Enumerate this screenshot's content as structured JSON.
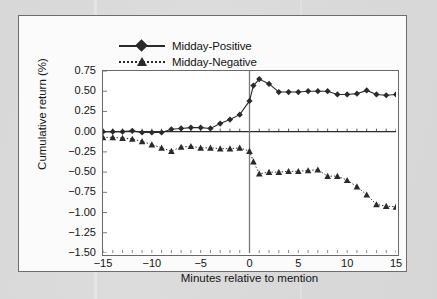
{
  "figure": {
    "background_color": "#d9d9d9",
    "panel_color": "#fbfbfb",
    "plot_background": "#ffffff",
    "axis_color": "#6a6a6a",
    "ink_color": "#2a2a2a"
  },
  "chart_data": {
    "type": "line",
    "title": "",
    "xlabel": "Minutes relative to mention",
    "ylabel": "Cumulative return (%)",
    "xlim": [
      -15,
      15
    ],
    "ylim": [
      -1.5,
      0.75
    ],
    "xticks": [
      -15,
      -10,
      -5,
      0,
      5,
      10,
      15
    ],
    "xticklabels": [
      "−15",
      "−10",
      "−5",
      "0",
      "5",
      "10",
      "15"
    ],
    "xminor_step": 1,
    "yticks": [
      0.75,
      0.5,
      0.25,
      0.0,
      -0.25,
      -0.5,
      -0.75,
      -1.0,
      -1.25,
      -1.5
    ],
    "yticklabels": [
      "0.75",
      "0.50",
      "0.25",
      "0.00",
      "−0.25",
      "−0.50",
      "−0.75",
      "−1.00",
      "−1.25",
      "−1.50"
    ],
    "grid": false,
    "legend_position": "above-plot",
    "reference_lines": [
      {
        "name": "zero-return-line",
        "axis": "horizontal",
        "value": 0.0
      },
      {
        "name": "mention-time-line",
        "axis": "vertical",
        "value": 0
      }
    ],
    "x": [
      -15,
      -14,
      -13,
      -12,
      -11,
      -10,
      -9,
      -8,
      -7,
      -6,
      -5,
      -4,
      -3,
      -2,
      -1,
      0,
      0.4,
      1,
      2,
      3,
      4,
      5,
      6,
      7,
      8,
      9,
      10,
      11,
      12,
      13,
      14,
      15
    ],
    "series": [
      {
        "name": "Midday-Positive",
        "marker": "diamond",
        "linestyle": "solid",
        "color": "#2a2a2a",
        "values": [
          0.0,
          0.0,
          0.0,
          0.01,
          -0.01,
          -0.01,
          -0.01,
          0.03,
          0.04,
          0.05,
          0.05,
          0.04,
          0.1,
          0.15,
          0.21,
          0.38,
          0.57,
          0.65,
          0.59,
          0.49,
          0.49,
          0.49,
          0.5,
          0.5,
          0.5,
          0.46,
          0.46,
          0.47,
          0.51,
          0.46,
          0.45,
          0.46
        ]
      },
      {
        "name": "Midday-Negative",
        "marker": "triangle",
        "linestyle": "dotted",
        "color": "#2a2a2a",
        "values": [
          -0.07,
          -0.07,
          -0.08,
          -0.09,
          -0.12,
          -0.16,
          -0.2,
          -0.24,
          -0.19,
          -0.18,
          -0.2,
          -0.2,
          -0.21,
          -0.21,
          -0.2,
          -0.24,
          -0.37,
          -0.52,
          -0.5,
          -0.5,
          -0.49,
          -0.49,
          -0.48,
          -0.47,
          -0.55,
          -0.55,
          -0.6,
          -0.68,
          -0.78,
          -0.9,
          -0.92,
          -0.93
        ]
      }
    ]
  }
}
